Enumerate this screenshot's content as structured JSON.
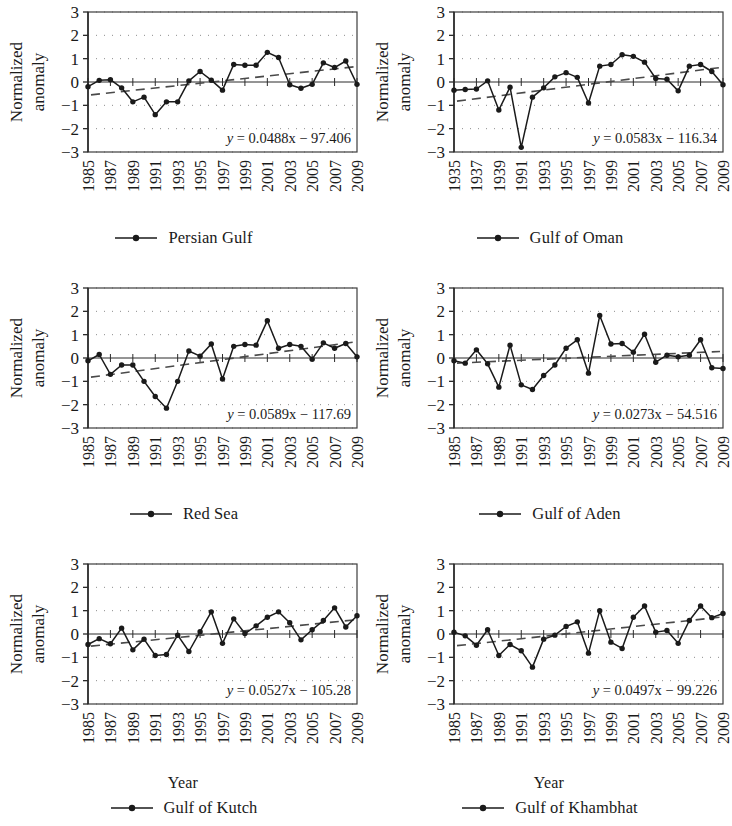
{
  "figure": {
    "axis_y_label": "Normalized\nanomaly",
    "axis_y_label_line1": "Normalized",
    "axis_y_label_line2": "anomaly",
    "axis_x_label": "Year",
    "y_ticks": [
      "3",
      "2",
      "1",
      "0",
      "−1",
      "−2",
      "−3"
    ],
    "marker_color": "#1a1a1a",
    "series_line_color": "#1a1a1a",
    "trend_line_color": "#4a4a4a",
    "grid_color": "#8c8c8c",
    "frame_color": "#3d3d3d"
  },
  "chart_data": [
    {
      "type": "line",
      "id": "persian-gulf",
      "title": "",
      "legend": "Persian Gulf",
      "xlabel": "",
      "ylabel": "Normalized anomaly",
      "ylim": [
        -3,
        3
      ],
      "yticks": [
        3,
        2,
        1,
        0,
        -1,
        -2,
        -3
      ],
      "grid": true,
      "legend_position": "bottom-center",
      "show_xlabel": false,
      "equation": "y = 0.0488x − 97.406",
      "equation_slope": 0.0488,
      "equation_intercept": -97.406,
      "xticks": [
        "1985",
        "1987",
        "1989",
        "1991",
        "1993",
        "1995",
        "1997",
        "1999",
        "2001",
        "2003",
        "2005",
        "2007",
        "2009"
      ],
      "x": [
        1985,
        1986,
        1987,
        1988,
        1989,
        1990,
        1991,
        1992,
        1993,
        1994,
        1995,
        1996,
        1997,
        1998,
        1999,
        2000,
        2001,
        2002,
        2003,
        2004,
        2005,
        2006,
        2007,
        2008,
        2009
      ],
      "values": [
        -0.2,
        0.07,
        0.1,
        -0.25,
        -0.85,
        -0.65,
        -1.4,
        -0.85,
        -0.85,
        0.05,
        0.45,
        0.08,
        -0.35,
        0.75,
        0.72,
        0.72,
        1.27,
        1.05,
        -0.12,
        -0.27,
        -0.1,
        0.82,
        0.62,
        0.9,
        -0.1
      ],
      "trend": [
        -0.55,
        0.65
      ]
    },
    {
      "type": "line",
      "id": "gulf-of-oman",
      "title": "",
      "legend": "Gulf of Oman",
      "xlabel": "",
      "ylabel": "Normalized anomaly",
      "ylim": [
        -3,
        3
      ],
      "yticks": [
        3,
        2,
        1,
        0,
        -1,
        -2,
        -3
      ],
      "grid": true,
      "legend_position": "bottom-center",
      "show_xlabel": false,
      "equation": "y = 0.0583x − 116.34",
      "equation_slope": 0.0583,
      "equation_intercept": -116.34,
      "xticks": [
        "1935",
        "1937",
        "1939",
        "1991",
        "1993",
        "1995",
        "1997",
        "1999",
        "2001",
        "2003",
        "2005",
        "2007",
        "2009"
      ],
      "x": [
        1985,
        1986,
        1987,
        1988,
        1989,
        1990,
        1991,
        1992,
        1993,
        1994,
        1995,
        1996,
        1997,
        1998,
        1999,
        2000,
        2001,
        2002,
        2003,
        2004,
        2005,
        2006,
        2007,
        2008,
        2009
      ],
      "values": [
        -0.35,
        -0.32,
        -0.3,
        0.05,
        -1.2,
        -0.22,
        -2.8,
        -0.65,
        -0.25,
        0.22,
        0.4,
        0.2,
        -0.9,
        0.68,
        0.75,
        1.17,
        1.1,
        0.85,
        0.15,
        0.12,
        -0.38,
        0.68,
        0.75,
        0.45,
        -0.12
      ],
      "trend": [
        -0.82,
        0.62
      ]
    },
    {
      "type": "line",
      "id": "red-sea",
      "title": "",
      "legend": "Red Sea",
      "xlabel": "",
      "ylabel": "Normalized anomaly",
      "ylim": [
        -3,
        3
      ],
      "yticks": [
        3,
        2,
        1,
        0,
        -1,
        -2,
        -3
      ],
      "grid": true,
      "legend_position": "bottom-center",
      "show_xlabel": false,
      "equation": "y = 0.0589x − 117.69",
      "equation_slope": 0.0589,
      "equation_intercept": -117.69,
      "xticks": [
        "1985",
        "1987",
        "1989",
        "1991",
        "1993",
        "1995",
        "1997",
        "1999",
        "2001",
        "2003",
        "2005",
        "2007",
        "2009"
      ],
      "x": [
        1985,
        1986,
        1987,
        1988,
        1989,
        1990,
        1991,
        1992,
        1993,
        1994,
        1995,
        1996,
        1997,
        1998,
        1999,
        2000,
        2001,
        2002,
        2003,
        2004,
        2005,
        2006,
        2007,
        2008,
        2009
      ],
      "values": [
        -0.12,
        0.15,
        -0.7,
        -0.3,
        -0.3,
        -1.0,
        -1.65,
        -2.15,
        -1.0,
        0.3,
        0.08,
        0.6,
        -0.9,
        0.5,
        0.58,
        0.55,
        1.6,
        0.42,
        0.58,
        0.5,
        -0.05,
        0.65,
        0.42,
        0.62,
        0.05
      ],
      "trend": [
        -0.82,
        0.68
      ]
    },
    {
      "type": "line",
      "id": "gulf-of-aden",
      "title": "",
      "legend": "Gulf of Aden",
      "xlabel": "",
      "ylabel": "Normalized anomaly",
      "ylim": [
        -3,
        3
      ],
      "yticks": [
        3,
        2,
        1,
        0,
        -1,
        -2,
        -3
      ],
      "grid": true,
      "legend_position": "bottom-center",
      "show_xlabel": false,
      "equation": "y = 0.0273x − 54.516",
      "equation_slope": 0.0273,
      "equation_intercept": -54.516,
      "xticks": [
        "1985",
        "1987",
        "1989",
        "1991",
        "1993",
        "1995",
        "1997",
        "1999",
        "2001",
        "2003",
        "2005",
        "2007",
        "2009"
      ],
      "x": [
        1985,
        1986,
        1987,
        1988,
        1989,
        1990,
        1991,
        1992,
        1993,
        1994,
        1995,
        1996,
        1997,
        1998,
        1999,
        2000,
        2001,
        2002,
        2003,
        2004,
        2005,
        2006,
        2007,
        2008,
        2009
      ],
      "values": [
        -0.12,
        -0.22,
        0.35,
        -0.25,
        -1.25,
        0.55,
        -1.15,
        -1.35,
        -0.75,
        -0.3,
        0.42,
        0.78,
        -0.65,
        1.82,
        0.6,
        0.62,
        0.25,
        1.02,
        -0.18,
        0.12,
        0.05,
        0.12,
        0.78,
        -0.42,
        -0.45
      ],
      "trend": [
        -0.22,
        0.28
      ]
    },
    {
      "type": "line",
      "id": "gulf-of-kutch",
      "title": "",
      "legend": "Gulf of Kutch",
      "xlabel": "Year",
      "ylabel": "Normalized anomaly",
      "ylim": [
        -3,
        3
      ],
      "yticks": [
        3,
        2,
        1,
        0,
        -1,
        -2,
        -3
      ],
      "grid": true,
      "legend_position": "bottom-center",
      "show_xlabel": true,
      "equation": "y = 0.0527x − 105.28",
      "equation_slope": 0.0527,
      "equation_intercept": -105.28,
      "xticks": [
        "1985",
        "1987",
        "1989",
        "1991",
        "1993",
        "1995",
        "1997",
        "1999",
        "2001",
        "2003",
        "2005",
        "2007",
        "2009"
      ],
      "x": [
        1985,
        1986,
        1987,
        1988,
        1989,
        1990,
        1991,
        1992,
        1993,
        1994,
        1995,
        1996,
        1997,
        1998,
        1999,
        2000,
        2001,
        2002,
        2003,
        2004,
        2005,
        2006,
        2007,
        2008,
        2009
      ],
      "values": [
        -0.45,
        -0.2,
        -0.42,
        0.25,
        -0.68,
        -0.22,
        -0.92,
        -0.88,
        -0.05,
        -0.75,
        0.1,
        0.95,
        -0.4,
        0.65,
        0.02,
        0.35,
        0.72,
        0.95,
        0.48,
        -0.25,
        0.18,
        0.58,
        1.12,
        0.3,
        0.78
      ],
      "trend": [
        -0.52,
        0.6
      ]
    },
    {
      "type": "line",
      "id": "gulf-of-khambhat",
      "title": "",
      "legend": "Gulf of Khambhat",
      "xlabel": "Year",
      "ylabel": "Normalized anomaly",
      "ylim": [
        -3,
        3
      ],
      "yticks": [
        3,
        2,
        1,
        0,
        -1,
        -2,
        -3
      ],
      "grid": true,
      "legend_position": "bottom-center",
      "show_xlabel": true,
      "equation": "y = 0.0497x − 99.226",
      "equation_slope": 0.0497,
      "equation_intercept": -99.226,
      "xticks": [
        "1985",
        "1987",
        "1989",
        "1991",
        "1993",
        "1995",
        "1997",
        "1999",
        "2001",
        "2003",
        "2005",
        "2007",
        "2009"
      ],
      "x": [
        1985,
        1986,
        1987,
        1988,
        1989,
        1990,
        1991,
        1992,
        1993,
        1994,
        1995,
        1996,
        1997,
        1998,
        1999,
        2000,
        2001,
        2002,
        2003,
        2004,
        2005,
        2006,
        2007,
        2008,
        2009
      ],
      "values": [
        0.08,
        -0.08,
        -0.48,
        0.18,
        -0.92,
        -0.45,
        -0.72,
        -1.42,
        -0.22,
        -0.05,
        0.32,
        0.52,
        -0.82,
        1.0,
        -0.35,
        -0.62,
        0.72,
        1.2,
        0.08,
        0.15,
        -0.4,
        0.58,
        1.2,
        0.7,
        0.88
      ],
      "trend": [
        -0.5,
        0.72
      ]
    }
  ]
}
